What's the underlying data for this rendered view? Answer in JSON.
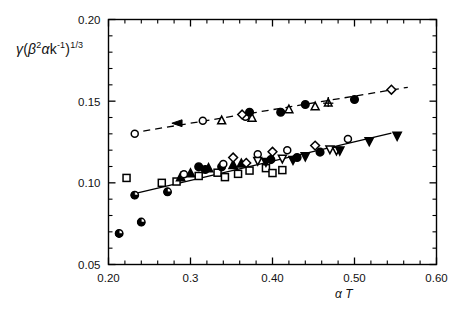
{
  "chart_data": {
    "type": "scatter",
    "title": "",
    "xlabel": "α T",
    "ylabel": "γ(β²αk⁻¹)^(1/3)",
    "xlim": [
      0.2,
      0.6
    ],
    "ylim": [
      0.05,
      0.2
    ],
    "xticks_major": [
      0.2,
      0.3,
      0.4,
      0.5,
      0.6
    ],
    "xtick_labels": [
      "0.20",
      "0.3",
      "0.40",
      "0.50",
      "0.60"
    ],
    "xticks_minor": [
      0.22,
      0.24,
      0.26,
      0.28,
      0.32,
      0.34,
      0.36,
      0.38,
      0.42,
      0.44,
      0.46,
      0.48,
      0.52,
      0.54,
      0.56,
      0.58
    ],
    "yticks_major": [
      0.05,
      0.1,
      0.15,
      0.2
    ],
    "ytick_labels": [
      "0.05",
      "0.10",
      "0.15",
      "0.20"
    ],
    "yticks_minor": [
      0.06,
      0.07,
      0.08,
      0.09,
      0.11,
      0.12,
      0.13,
      0.14,
      0.16,
      0.17,
      0.18,
      0.19
    ],
    "grid": false,
    "legend": "none",
    "axis_color": "#000000",
    "marker_color": "#000000",
    "fit_lines": [
      {
        "name": "upper-dashed-fit",
        "style": "dashed",
        "x": [
          0.228,
          0.565
        ],
        "y": [
          0.1305,
          0.1585
        ]
      },
      {
        "name": "lower-solid-fit",
        "style": "solid",
        "x": [
          0.233,
          0.545
        ],
        "y": [
          0.0935,
          0.1305
        ]
      }
    ],
    "annotations": [
      {
        "name": "left-arrow-marker",
        "shape": "left-arrow",
        "x": 0.284,
        "y": 0.1365
      }
    ],
    "series": [
      {
        "name": "upper-open-circle",
        "marker": "open-circle",
        "points": [
          {
            "x": 0.232,
            "y": 0.13
          },
          {
            "x": 0.315,
            "y": 0.138
          },
          {
            "x": 0.367,
            "y": 0.1405
          }
        ]
      },
      {
        "name": "upper-open-triangle",
        "marker": "open-triangle-up",
        "points": [
          {
            "x": 0.338,
            "y": 0.1382
          },
          {
            "x": 0.375,
            "y": 0.1398
          },
          {
            "x": 0.42,
            "y": 0.145
          },
          {
            "x": 0.452,
            "y": 0.1468
          }
        ]
      },
      {
        "name": "upper-open-diamond",
        "marker": "open-diamond",
        "points": [
          {
            "x": 0.363,
            "y": 0.1418
          },
          {
            "x": 0.545,
            "y": 0.157
          }
        ]
      },
      {
        "name": "upper-filled-circle",
        "marker": "filled-circle",
        "points": [
          {
            "x": 0.372,
            "y": 0.1432
          },
          {
            "x": 0.41,
            "y": 0.1432
          },
          {
            "x": 0.44,
            "y": 0.148
          },
          {
            "x": 0.5,
            "y": 0.151
          }
        ]
      },
      {
        "name": "upper-open-star",
        "marker": "open-star-triangle",
        "points": [
          {
            "x": 0.468,
            "y": 0.149
          }
        ]
      },
      {
        "name": "lower-half-filled-circle",
        "marker": "half-filled-circle",
        "points": [
          {
            "x": 0.213,
            "y": 0.069
          },
          {
            "x": 0.24,
            "y": 0.076
          },
          {
            "x": 0.232,
            "y": 0.0925
          },
          {
            "x": 0.272,
            "y": 0.0945
          }
        ]
      },
      {
        "name": "lower-open-square",
        "marker": "open-square",
        "points": [
          {
            "x": 0.222,
            "y": 0.103
          },
          {
            "x": 0.265,
            "y": 0.1
          },
          {
            "x": 0.283,
            "y": 0.1008
          },
          {
            "x": 0.31,
            "y": 0.1042
          },
          {
            "x": 0.333,
            "y": 0.1062
          },
          {
            "x": 0.342,
            "y": 0.1035
          },
          {
            "x": 0.358,
            "y": 0.1055
          },
          {
            "x": 0.372,
            "y": 0.1075
          },
          {
            "x": 0.392,
            "y": 0.109
          },
          {
            "x": 0.4,
            "y": 0.106
          },
          {
            "x": 0.412,
            "y": 0.1078
          }
        ]
      },
      {
        "name": "lower-filled-triangle-up",
        "marker": "filled-triangle-up",
        "points": [
          {
            "x": 0.288,
            "y": 0.1035
          },
          {
            "x": 0.3,
            "y": 0.1058
          },
          {
            "x": 0.322,
            "y": 0.109
          },
          {
            "x": 0.352,
            "y": 0.111
          },
          {
            "x": 0.362,
            "y": 0.1118
          }
        ]
      },
      {
        "name": "lower-filled-circle",
        "marker": "filled-circle",
        "points": [
          {
            "x": 0.31,
            "y": 0.1098
          },
          {
            "x": 0.318,
            "y": 0.1082
          },
          {
            "x": 0.338,
            "y": 0.1098
          },
          {
            "x": 0.398,
            "y": 0.1142
          },
          {
            "x": 0.43,
            "y": 0.1155
          },
          {
            "x": 0.458,
            "y": 0.1188
          }
        ]
      },
      {
        "name": "lower-open-circle",
        "marker": "open-circle",
        "points": [
          {
            "x": 0.292,
            "y": 0.1052
          },
          {
            "x": 0.34,
            "y": 0.1115
          },
          {
            "x": 0.382,
            "y": 0.1175
          },
          {
            "x": 0.418,
            "y": 0.12
          },
          {
            "x": 0.492,
            "y": 0.1268
          }
        ]
      },
      {
        "name": "lower-open-diamond",
        "marker": "open-diamond",
        "points": [
          {
            "x": 0.352,
            "y": 0.1155
          },
          {
            "x": 0.368,
            "y": 0.1122
          },
          {
            "x": 0.4,
            "y": 0.119
          },
          {
            "x": 0.452,
            "y": 0.1228
          }
        ]
      },
      {
        "name": "lower-open-triangle-down",
        "marker": "open-triangle-down",
        "points": [
          {
            "x": 0.382,
            "y": 0.1135
          },
          {
            "x": 0.412,
            "y": 0.1148
          },
          {
            "x": 0.47,
            "y": 0.1205
          },
          {
            "x": 0.478,
            "y": 0.1198
          }
        ]
      },
      {
        "name": "lower-filled-triangle-down",
        "marker": "filled-triangle-down",
        "points": [
          {
            "x": 0.392,
            "y": 0.1128
          },
          {
            "x": 0.425,
            "y": 0.114
          },
          {
            "x": 0.44,
            "y": 0.1162
          },
          {
            "x": 0.482,
            "y": 0.1198
          },
          {
            "x": 0.518,
            "y": 0.1255
          },
          {
            "x": 0.552,
            "y": 0.1288
          }
        ]
      }
    ]
  },
  "axes": {
    "x_title": "α T",
    "y_title_parts": {
      "gamma": "γ",
      "open_paren": "(",
      "beta": "β",
      "beta_exp": "2",
      "alpha": "α",
      "k": "k",
      "k_exp": "-1",
      "close_paren": ")",
      "outer_exp": "1/3"
    }
  }
}
